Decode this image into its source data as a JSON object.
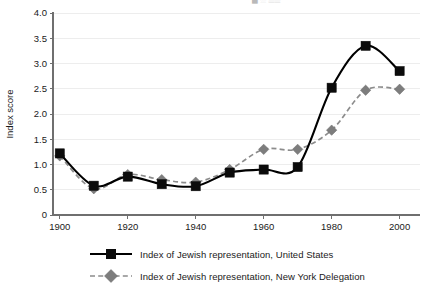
{
  "figure": {
    "top_cut_text": "█ ░  ▒▒",
    "axis": {
      "ylabel": "Index score",
      "xlabel": "",
      "yticks": [
        "0",
        "0.5",
        "1.0",
        "1.5",
        "2.0",
        "2.5",
        "3.0",
        "3.5",
        "4.0"
      ],
      "xticks": [
        "1900",
        "1920",
        "1940",
        "1960",
        "1980",
        "2000"
      ]
    },
    "legend": {
      "items": [
        {
          "label": "Index of Jewish representation, United States",
          "marker": "square-marker",
          "line": "solid",
          "color": "#000000"
        },
        {
          "label": "Index of Jewish representation, New York Delegation",
          "marker": "diamond-marker",
          "line": "dashed",
          "color": "#7d7d7d"
        }
      ]
    }
  },
  "chart_data": {
    "type": "line",
    "title": "",
    "subtitle": "",
    "xlabel": "",
    "ylabel": "Index score",
    "xlim": [
      1898,
      2006
    ],
    "ylim": [
      0,
      4.0
    ],
    "ytick_values": [
      0,
      0.5,
      1.0,
      1.5,
      2.0,
      2.5,
      3.0,
      3.5,
      4.0
    ],
    "xtick_values": [
      1900,
      1920,
      1940,
      1960,
      1980,
      2000
    ],
    "grid": "horizontal",
    "legend_position": "bottom",
    "x": [
      1900,
      1910,
      1920,
      1930,
      1940,
      1950,
      1960,
      1970,
      1980,
      1990,
      2000
    ],
    "series": [
      {
        "name": "Index of Jewish representation, United States",
        "color": "#000000",
        "marker": "square",
        "linestyle": "solid",
        "values": [
          1.22,
          0.58,
          0.76,
          0.61,
          0.57,
          0.84,
          0.9,
          0.95,
          2.52,
          3.35,
          2.85
        ]
      },
      {
        "name": "Index of Jewish representation, New York Delegation",
        "color": "#7d7d7d",
        "marker": "diamond",
        "linestyle": "dashed",
        "values": [
          1.17,
          0.52,
          0.8,
          0.7,
          0.65,
          0.9,
          1.3,
          1.3,
          1.68,
          2.47,
          2.49
        ]
      }
    ]
  }
}
